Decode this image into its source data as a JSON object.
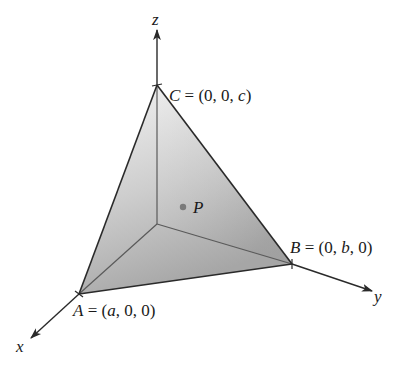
{
  "diagram": {
    "type": "3d-coordinate-tetrahedron",
    "axes": {
      "x": {
        "label": "x"
      },
      "y": {
        "label": "y"
      },
      "z": {
        "label": "z"
      }
    },
    "vertices": {
      "A": {
        "name": "A",
        "eq": " = (",
        "c1": "a",
        "sep1": ", 0, 0)",
        "coords": "(a, 0, 0)"
      },
      "B": {
        "name": "B",
        "eq": " = (0, ",
        "c1": "b",
        "sep1": ", 0)",
        "coords": "(0, b, 0)"
      },
      "C": {
        "name": "C",
        "eq": " = (0, 0, ",
        "c1": "c",
        "sep1": ")",
        "coords": "(0, 0, c)"
      }
    },
    "point": {
      "label": "P"
    },
    "colors": {
      "line": "#2a2a2a",
      "inner_edge": "#555555",
      "shade_top": "#f2f2f2",
      "shade_bottom": "#a9a9a9",
      "point": "#777777"
    }
  }
}
